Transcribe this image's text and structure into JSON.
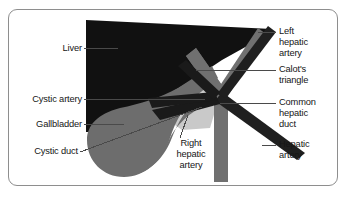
{
  "figure": {
    "background_color": "#ffffff",
    "frame_color": "#8e8e8e"
  },
  "palette": {
    "liver": "#111111",
    "gallbladder": "#6d6d6d",
    "duct": "#707070",
    "artery_dark": "#1f1f1f",
    "calot_triangle": "#c9c9c9",
    "cystic_artery": "#1a1a1a",
    "leader_line": "#4a4a4a",
    "text": "#161616"
  },
  "labels": {
    "liver": {
      "text": "Liver",
      "side": "left"
    },
    "cystic_artery": {
      "text": "Cystic artery",
      "side": "left"
    },
    "gallbladder": {
      "text": "Gallbladder",
      "side": "left"
    },
    "cystic_duct": {
      "text": "Cystic duct",
      "side": "left"
    },
    "left_hepatic_artery": {
      "text": "Left\nhepatic\nartery",
      "side": "right"
    },
    "calots_triangle": {
      "text": "Calot's\ntriangle",
      "side": "right"
    },
    "common_hepatic_duct": {
      "text": "Common\nhepatic\nduct",
      "side": "right"
    },
    "hepatic_artery": {
      "text": "Hepatic\nartery",
      "side": "right"
    },
    "right_hepatic_artery": {
      "text": "Right\nhepatic\nartery",
      "side": "center"
    }
  },
  "structures": [
    {
      "key": "liver",
      "name": "Liver",
      "color": "#111111"
    },
    {
      "key": "gallbladder",
      "name": "Gallbladder",
      "color": "#6d6d6d"
    },
    {
      "key": "cystic_duct",
      "name": "Cystic duct",
      "color": "#6d6d6d"
    },
    {
      "key": "common_hepatic_duct",
      "name": "Common hepatic duct",
      "color": "#707070"
    },
    {
      "key": "hepatic_artery",
      "name": "Hepatic artery",
      "color": "#1f1f1f"
    },
    {
      "key": "left_hepatic_artery",
      "name": "Left hepatic artery",
      "color": "#1f1f1f"
    },
    {
      "key": "right_hepatic_artery",
      "name": "Right hepatic artery",
      "color": "#1f1f1f"
    },
    {
      "key": "cystic_artery",
      "name": "Cystic artery",
      "color": "#1a1a1a"
    },
    {
      "key": "calots_triangle",
      "name": "Calot's triangle",
      "color": "#c9c9c9"
    }
  ]
}
